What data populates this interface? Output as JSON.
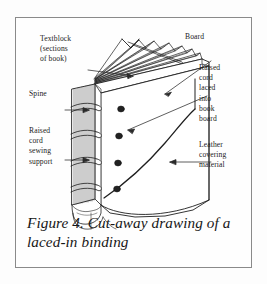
{
  "figure": {
    "caption": "Figure 4. Cut-away drawing of a laced-in binding",
    "frame_color": "#8a8a8a",
    "background_color": "#fefefe",
    "ink_color": "#1b1b1b"
  },
  "labels": {
    "textblock": "Textblock\n(sections\nof book)",
    "board": "Board",
    "spine": "Spine",
    "raised_cord_laced": "Raised\ncord\nlaced\ninto\nbook\nboard",
    "raised_cord_sewing": "Raised\ncord\nsewing\nsupport",
    "leather": "Leather\ncovering\nmaterial"
  },
  "diagram": {
    "section_count": 11,
    "raised_cord_count": 4,
    "lacing_hole_count": 4,
    "arrows": [
      {
        "name": "textblock-arrow",
        "points_to": "fanned sections at top of spine"
      },
      {
        "name": "board-arrow",
        "points_to": "front board edge"
      },
      {
        "name": "spine-arrow",
        "points_to": "spine of book"
      },
      {
        "name": "raised-cord-laced-arrow",
        "points_to": "lacing hole in board"
      },
      {
        "name": "raised-cord-sewing-arrow",
        "points_to": "raised cord on spine"
      },
      {
        "name": "leather-arrow",
        "points_to": "leather covering on front board"
      }
    ]
  }
}
